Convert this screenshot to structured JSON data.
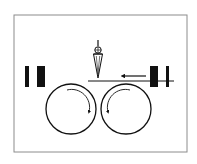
{
  "diagram": {
    "colors": {
      "background": "#ffffff",
      "frame": "#8c8c8c",
      "stroke": "#111111",
      "fill": "#111111"
    },
    "frame": {
      "x": 14,
      "y": 15,
      "width": 173,
      "height": 137
    },
    "elements": [
      {
        "id": "left-bar-thin",
        "type": "bar",
        "x": 25,
        "y": 66,
        "width": 4,
        "height": 21
      },
      {
        "id": "left-bar-wide",
        "type": "bar",
        "x": 37,
        "y": 66,
        "width": 8,
        "height": 21
      },
      {
        "id": "right-bar-wide",
        "type": "bar",
        "x": 150,
        "y": 66,
        "width": 8,
        "height": 21
      },
      {
        "id": "right-bar-thin",
        "type": "bar",
        "x": 166,
        "y": 66,
        "width": 3,
        "height": 21
      },
      {
        "id": "material-line",
        "type": "line",
        "x1": 88,
        "y1": 81,
        "x2": 174,
        "y2": 81
      },
      {
        "id": "feed-arrow",
        "type": "arrow",
        "x1": 146,
        "y1": 76,
        "x2": 120,
        "y2": 76,
        "direction": "left"
      },
      {
        "id": "left-roller",
        "type": "circle",
        "cx": 71,
        "cy": 109,
        "r": 25,
        "rotation": "clockwise"
      },
      {
        "id": "right-roller",
        "type": "circle",
        "cx": 126,
        "cy": 109,
        "r": 25,
        "rotation": "counter-clockwise"
      },
      {
        "id": "blade",
        "type": "knife",
        "cx": 98,
        "top": 40,
        "hub_y": 50,
        "tip_y": 78
      }
    ]
  }
}
